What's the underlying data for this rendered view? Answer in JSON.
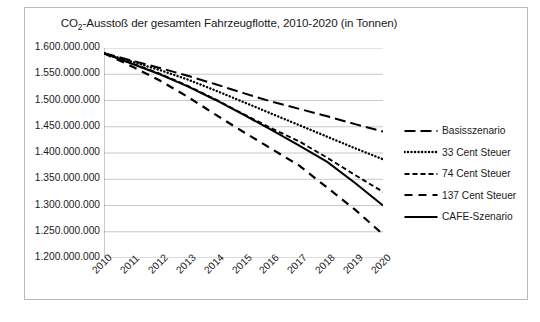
{
  "chart_data": {
    "type": "line",
    "title": "CO2-Ausstoß der gesamten Fahrzeugflotte, 2010-2020 (in Tonnen)",
    "title_prefix": "CO",
    "title_sub": "2",
    "title_rest": "-Ausstoß der gesamten Fahrzeugflotte, 2010-2020 (in Tonnen)",
    "xlabel": "",
    "ylabel": "",
    "categories": [
      "2010",
      "2011",
      "2012",
      "2013",
      "2014",
      "2015",
      "2016",
      "2017",
      "2018",
      "2019",
      "2020"
    ],
    "x": [
      2010,
      2011,
      2012,
      2013,
      2014,
      2015,
      2016,
      2017,
      2018,
      2019,
      2020
    ],
    "ylim": [
      1200000000,
      1600000000
    ],
    "ytick_values": [
      1600000000,
      1550000000,
      1500000000,
      1450000000,
      1400000000,
      1350000000,
      1300000000,
      1250000000,
      1200000000
    ],
    "ytick_labels": [
      "1.600.000.000",
      "1.550.000.000",
      "1.500.000.000",
      "1.450.000.000",
      "1.400.000.000",
      "1.350.000.000",
      "1.300.000.000",
      "1.250.000.000",
      "1.200.000.000"
    ],
    "grid": true,
    "legend_position": "right",
    "series": [
      {
        "name": "Basisszenario",
        "style": "long-dash",
        "color": "#000000",
        "values": [
          1590000000,
          1576000000,
          1562000000,
          1547000000,
          1531000000,
          1514000000,
          1498000000,
          1484000000,
          1470000000,
          1455000000,
          1441000000
        ]
      },
      {
        "name": "33 Cent Steuer",
        "style": "dotted",
        "color": "#000000",
        "values": [
          1590000000,
          1574000000,
          1558000000,
          1540000000,
          1519000000,
          1497000000,
          1475000000,
          1453000000,
          1431000000,
          1409000000,
          1388000000
        ]
      },
      {
        "name": "74 Cent Steuer",
        "style": "dash",
        "color": "#000000",
        "values": [
          1590000000,
          1571000000,
          1551000000,
          1528000000,
          1502000000,
          1474000000,
          1447000000,
          1422000000,
          1391000000,
          1358000000,
          1326000000
        ]
      },
      {
        "name": "137 Cent Steuer",
        "style": "wide-dash",
        "color": "#000000",
        "values": [
          1590000000,
          1565000000,
          1538000000,
          1507000000,
          1473000000,
          1440000000,
          1408000000,
          1376000000,
          1334000000,
          1292000000,
          1245000000
        ]
      },
      {
        "name": "CAFE-Szenario",
        "style": "solid",
        "color": "#000000",
        "values": [
          1590000000,
          1570000000,
          1550000000,
          1527000000,
          1501000000,
          1473000000,
          1444000000,
          1414000000,
          1383000000,
          1343000000,
          1300000000
        ]
      }
    ]
  },
  "caption": {
    "text": ""
  }
}
